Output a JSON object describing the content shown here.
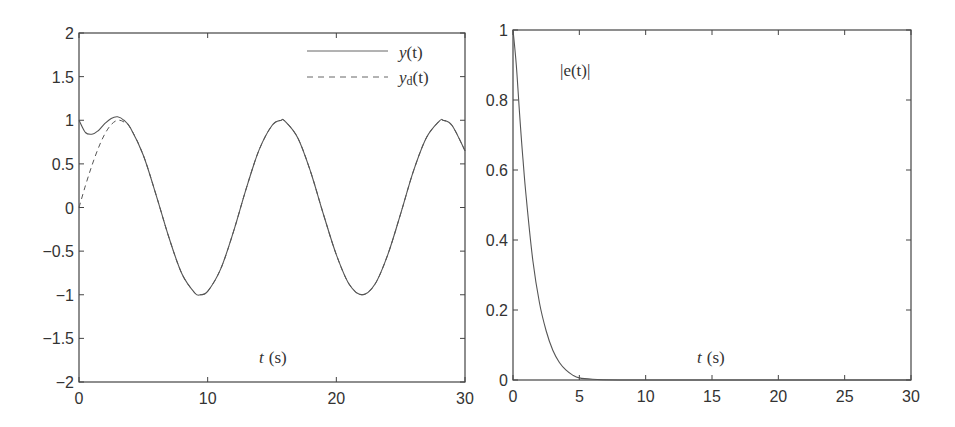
{
  "chart_data": [
    {
      "type": "line",
      "title": "",
      "xlabel": "t (s)",
      "ylabel": "",
      "xlim": [
        0,
        30
      ],
      "ylim": [
        -2,
        2
      ],
      "x_ticks": [
        "0",
        "10",
        "20",
        "30"
      ],
      "y_ticks": [
        "2",
        "1.5",
        "1",
        "0.5",
        "0",
        "−0.5",
        "−1",
        "−1.5",
        "−2"
      ],
      "grid": false,
      "legend_position": "upper right",
      "series": [
        {
          "name": "y(t)",
          "style": "solid",
          "x": [
            0,
            0.5,
            1,
            1.5,
            2,
            2.5,
            3,
            3.5,
            4,
            5,
            6,
            7,
            8,
            9,
            9.42,
            10,
            11,
            12,
            13,
            14,
            15,
            15.7,
            16,
            17,
            18,
            19,
            20,
            21,
            22,
            23,
            24,
            25,
            26,
            27,
            28,
            28.3,
            29,
            30
          ],
          "values": [
            1.0,
            0.86,
            0.84,
            0.88,
            0.96,
            1.02,
            1.04,
            1.0,
            0.91,
            0.6,
            0.14,
            -0.35,
            -0.76,
            -0.98,
            -1.0,
            -0.96,
            -0.71,
            -0.28,
            0.22,
            0.66,
            0.94,
            1.0,
            0.99,
            0.8,
            0.41,
            -0.08,
            -0.54,
            -0.88,
            -1.0,
            -0.88,
            -0.54,
            -0.07,
            0.42,
            0.8,
            0.99,
            1.0,
            0.94,
            0.65
          ]
        },
        {
          "name": "y_d(t)",
          "style": "dashed",
          "x": [
            0,
            0.5,
            1,
            1.5,
            2,
            2.5,
            3,
            3.5,
            4,
            5,
            6,
            7,
            8,
            9,
            9.42,
            10,
            11,
            12,
            13,
            14,
            15,
            15.7,
            16,
            17,
            18,
            19,
            20,
            21,
            22,
            23,
            24,
            25,
            26,
            27,
            28,
            28.3,
            29,
            30
          ],
          "values": [
            0.0,
            0.25,
            0.48,
            0.68,
            0.84,
            0.95,
            1.0,
            0.98,
            0.91,
            0.6,
            0.14,
            -0.35,
            -0.76,
            -0.98,
            -1.0,
            -0.96,
            -0.71,
            -0.28,
            0.22,
            0.66,
            0.94,
            1.0,
            0.99,
            0.8,
            0.41,
            -0.08,
            -0.54,
            -0.88,
            -1.0,
            -0.88,
            -0.54,
            -0.07,
            0.42,
            0.8,
            0.99,
            1.0,
            0.94,
            0.65
          ]
        }
      ],
      "annotations": [
        "t (s)"
      ]
    },
    {
      "type": "line",
      "title": "",
      "xlabel": "t (s)",
      "ylabel": "",
      "xlim": [
        0,
        30
      ],
      "ylim": [
        0,
        1
      ],
      "x_ticks": [
        "0",
        "5",
        "10",
        "15",
        "20",
        "25",
        "30"
      ],
      "y_ticks": [
        "1",
        "0.8",
        "0.6",
        "0.4",
        "0.2",
        "0"
      ],
      "grid": false,
      "series": [
        {
          "name": "|e(t)|",
          "style": "solid",
          "x": [
            0,
            0.25,
            0.5,
            0.75,
            1,
            1.5,
            2,
            2.5,
            3,
            3.5,
            4,
            4.5,
            5,
            6,
            8,
            10,
            15,
            20,
            25,
            30
          ],
          "values": [
            1.0,
            0.9,
            0.76,
            0.63,
            0.52,
            0.34,
            0.22,
            0.14,
            0.085,
            0.05,
            0.028,
            0.014,
            0.006,
            0.002,
            0.0,
            0.0,
            0.0,
            0.0,
            0.0,
            0.0
          ]
        }
      ],
      "annotations": [
        "|e(t)|",
        "t (s)"
      ]
    }
  ],
  "left": {
    "legend": [
      {
        "label_main": "y",
        "label_sub": "",
        "label_arg": "(t)",
        "style": "solid"
      },
      {
        "label_main": "y",
        "label_sub": "d",
        "label_arg": "(t)",
        "style": "dashed"
      }
    ],
    "xlabel_var": "t",
    "xlabel_unit": "(s)"
  },
  "right": {
    "annotation": "|e(t)|",
    "xlabel_var": "t",
    "xlabel_unit": "(s)"
  },
  "colors": {
    "line": "#555555",
    "axes": "#444444",
    "text": "#333333"
  }
}
